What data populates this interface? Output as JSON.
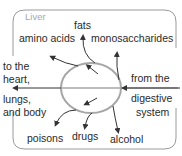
{
  "diagram": {
    "title": "Liver",
    "inputs": {
      "from": [
        "from the",
        "digestive",
        "system"
      ]
    },
    "outputs": {
      "to": [
        "to the",
        "heart,",
        "lungs,",
        "and body"
      ]
    },
    "products_up": [
      "amino acids",
      "fats",
      "monosaccharides"
    ],
    "products_down": [
      "poisons",
      "drugs",
      "alcohol"
    ],
    "colors": {
      "border": "#9a9a9a",
      "ellipse": "#a0a0a0",
      "arrow": "#333333",
      "text": "#2a2a2a",
      "title": "#a8a8a8"
    }
  }
}
